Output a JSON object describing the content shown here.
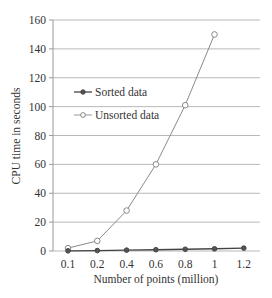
{
  "chart_data": {
    "type": "line",
    "title": "",
    "xlabel": "Number of points (million)",
    "ylabel": "CPU time in seconds",
    "categories": [
      "0.1",
      "0.2",
      "0.4",
      "0.6",
      "0.8",
      "1",
      "1.2"
    ],
    "ylim": [
      0,
      160
    ],
    "yticks": [
      0,
      20,
      40,
      60,
      80,
      100,
      120,
      140,
      160
    ],
    "grid": "horizontal",
    "legend_position": "upper-left inside",
    "series": [
      {
        "name": "Sorted data",
        "marker": "filled-diamond",
        "color": "#444444",
        "values": [
          0.1,
          0.3,
          0.6,
          0.9,
          1.2,
          1.5,
          2.0
        ]
      },
      {
        "name": "Unsorted data",
        "marker": "hollow-circle",
        "color": "#888888",
        "values": [
          2,
          7,
          28,
          60,
          101,
          150,
          null
        ]
      }
    ]
  },
  "labels": {
    "xlabel": "Number of points (million)",
    "ylabel": "CPU time in seconds",
    "legend_sorted": "Sorted data",
    "legend_unsorted": "Unsorted data"
  }
}
